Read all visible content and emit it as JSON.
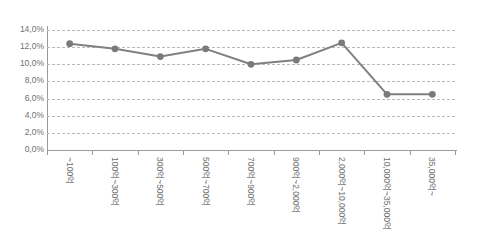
{
  "chart_data": {
    "type": "line",
    "title": "",
    "xlabel": "",
    "ylabel": "",
    "ylim": [
      0,
      14
    ],
    "ytick_step": 2,
    "grid": true,
    "legend": "none",
    "y_unit": "%",
    "y_ticks": [
      "0,0%",
      "2,0%",
      "4,0%",
      "6,0%",
      "8,0%",
      "10,0%",
      "12,0%",
      "14,0%"
    ],
    "y_tick_values": [
      0,
      2,
      4,
      6,
      8,
      10,
      12,
      14
    ],
    "categories": [
      "~100억",
      "100억~300억",
      "300억~500억",
      "500억~700억",
      "700억~900억",
      "900억~2,000억",
      "2,000억~10,000억",
      "10,000억~35,000억",
      "35,000억~"
    ],
    "values": [
      12.4,
      11.8,
      10.9,
      11.8,
      10.0,
      10.5,
      12.5,
      6.5,
      6.5
    ],
    "series": [
      {
        "name": "series-1",
        "values": [
          12.4,
          11.8,
          10.9,
          11.8,
          10.0,
          10.5,
          12.5,
          6.5,
          6.5
        ]
      }
    ],
    "colors": {
      "line": "#808080",
      "marker": "#7a7a7a",
      "gridline": "#b9b9c4",
      "axis": "#9a9a9a",
      "tick_text": "#6f6f6f",
      "background": "#ffffff"
    },
    "marker_style": "circle",
    "line_width": 2
  }
}
